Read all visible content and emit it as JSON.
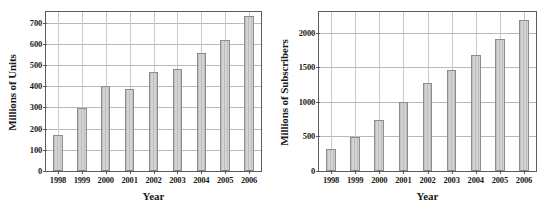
{
  "figure": {
    "background_color": "#ffffff",
    "bar_fill_color": "#d3d3d3",
    "bar_edge_color": "#8d8d8d",
    "axis_color": "#5b5b5b",
    "grid_color": "#b9b9b9"
  },
  "chart_data": [
    {
      "type": "bar",
      "panel": "left",
      "title": "",
      "xlabel": "Year",
      "ylabel": "Millions of Units",
      "categories": [
        "1998",
        "1999",
        "2000",
        "2001",
        "2002",
        "2003",
        "2004",
        "2005",
        "2006"
      ],
      "values": [
        172,
        295,
        403,
        389,
        466,
        479,
        555,
        618,
        730
      ],
      "ylim": [
        0,
        750
      ],
      "yticks": [
        0,
        100,
        200,
        300,
        400,
        500,
        600,
        700
      ],
      "ytick_labels": [
        "0",
        "100",
        "200",
        "300",
        "400",
        "500",
        "600",
        "700"
      ],
      "grid": true,
      "legend": "none"
    },
    {
      "type": "bar",
      "panel": "right",
      "title": "",
      "xlabel": "Year",
      "ylabel": "Millions of Subscribers",
      "categories": [
        "1998",
        "1999",
        "2000",
        "2001",
        "2002",
        "2003",
        "2004",
        "2005",
        "2006"
      ],
      "values": [
        312,
        490,
        740,
        1000,
        1270,
        1460,
        1680,
        1910,
        2190
      ],
      "ylim": [
        0,
        2300
      ],
      "yticks": [
        0,
        500,
        1000,
        1500,
        2000
      ],
      "ytick_labels": [
        "0",
        "500",
        "1000",
        "1500",
        "2000"
      ],
      "grid": true,
      "legend": "none"
    }
  ]
}
